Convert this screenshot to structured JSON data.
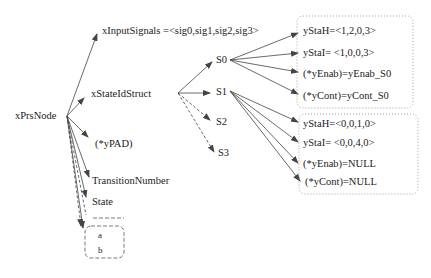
{
  "root": {
    "label": "xPrsNode"
  },
  "fields": [
    {
      "label": "xInputSignals =<sig0,sig1,sig2,sig3>"
    },
    {
      "label": "xStateIdStruct"
    },
    {
      "label": "(*yPAD)"
    },
    {
      "label": "TransitionNumber"
    },
    {
      "label": "State"
    }
  ],
  "pad_box": {
    "items": [
      "a",
      "b"
    ]
  },
  "states": [
    {
      "label": "S0"
    },
    {
      "label": "S1"
    },
    {
      "label": "S2"
    },
    {
      "label": "S3"
    }
  ],
  "s0_box": {
    "items": [
      "yStaH=<1,2,0,3>",
      "yStaI= <1,0,0,3>",
      "(*yEnab)=yEnab_S0",
      "(*yCont)=yCont_S0"
    ]
  },
  "s1_box": {
    "items": [
      "yStaH=<0,0,1,0>",
      "yStaI= <0,0,4,0>",
      "(*yEnab)=NULL",
      "(*yCont)=NULL"
    ]
  },
  "colors": {
    "line": "#444444",
    "text": "#222222",
    "box_border": "#888888"
  }
}
